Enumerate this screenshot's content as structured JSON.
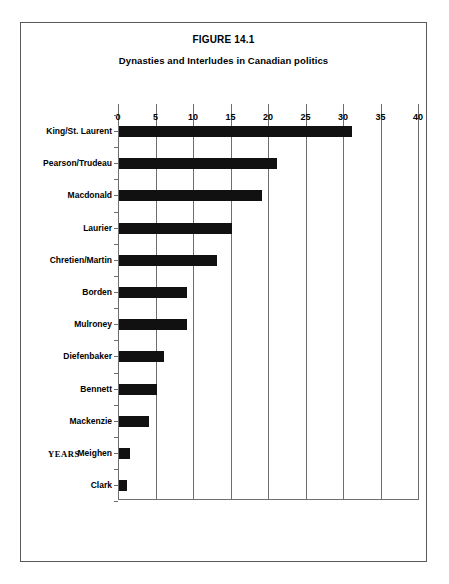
{
  "figure": {
    "title": "FIGURE 14.1",
    "subtitle": "Dynasties and Interludes in Canadian politics"
  },
  "chart_data": {
    "type": "bar",
    "orientation": "horizontal",
    "title": "FIGURE 14.1",
    "subtitle": "Dynasties and Interludes in Canadian politics",
    "xlabel": "YEARS",
    "ylabel": "",
    "xlim": [
      0,
      40
    ],
    "xticks": [
      0,
      5,
      10,
      15,
      20,
      25,
      30,
      35,
      40
    ],
    "xtick_labels": [
      "0",
      "5",
      "10",
      "15",
      "20",
      "25",
      "30",
      "35",
      "40"
    ],
    "grid": "vertical",
    "legend": "none",
    "bar_color": "#111111",
    "categories": [
      "King/St. Laurent",
      "Pearson/Trudeau",
      "Macdonald",
      "Laurier",
      "Chretien/Martin",
      "Borden",
      "Mulroney",
      "Diefenbaker",
      "Bennett",
      "Mackenzie",
      "Meighen",
      "Clark"
    ],
    "values": [
      31,
      21,
      19,
      15,
      13,
      9,
      9,
      6,
      5,
      4,
      1.5,
      1
    ]
  }
}
